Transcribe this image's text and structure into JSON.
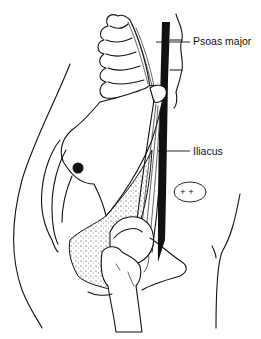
{
  "figure": {
    "labels": [
      {
        "id": "psoas-major",
        "text": "Psoas major"
      },
      {
        "id": "iliacus",
        "text": "Iliacus"
      }
    ],
    "marker": {
      "text": "+ +"
    }
  },
  "colors": {
    "ink": "#111111",
    "background": "#ffffff"
  }
}
